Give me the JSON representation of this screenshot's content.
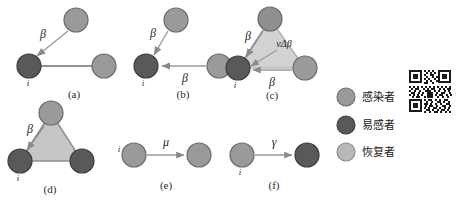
{
  "figure": {
    "title": "",
    "type": "diagram",
    "colors": {
      "infected": "#9a9a9a",
      "susceptible": "#595959",
      "recovered": "#b8b8b8",
      "node_stroke": "#4a4a4a",
      "edge": "#6e6e6e",
      "arrow": "#8a8a8a",
      "triangle_fill": "#c9c9c9",
      "text": "#1f1f1f",
      "background": "#ffffff"
    },
    "panels": [
      {
        "id": "a",
        "caption": "(a)",
        "nodes": [
          {
            "name": "top",
            "state": "infected",
            "cx": 76,
            "cy": 20,
            "r": 12
          },
          {
            "name": "left",
            "state": "susceptible",
            "cx": 29,
            "cy": 66,
            "r": 12,
            "label": "i"
          },
          {
            "name": "right",
            "state": "infected",
            "cx": 104,
            "cy": 66,
            "r": 12
          }
        ],
        "edges": [
          {
            "from": "left",
            "to": "right",
            "kind": "line"
          }
        ],
        "arrows": [
          {
            "from": "top",
            "to": "left",
            "label": "β"
          }
        ],
        "triangle": false
      },
      {
        "id": "b",
        "caption": "(b)",
        "nodes": [
          {
            "name": "top",
            "state": "infected",
            "cx": 176,
            "cy": 20,
            "r": 12
          },
          {
            "name": "left",
            "state": "susceptible",
            "cx": 146,
            "cy": 66,
            "r": 12,
            "label": "i"
          },
          {
            "name": "right",
            "state": "infected",
            "cx": 219,
            "cy": 66,
            "r": 12
          }
        ],
        "edges": [],
        "arrows": [
          {
            "from": "top",
            "to": "left",
            "label": "β"
          },
          {
            "from": "right",
            "to": "left",
            "label": "β"
          }
        ],
        "triangle": false
      },
      {
        "id": "c",
        "caption": "(c)",
        "nodes": [
          {
            "name": "top",
            "state": "infected",
            "cx": 270,
            "cy": 19,
            "r": 12
          },
          {
            "name": "left",
            "state": "susceptible",
            "cx": 238,
            "cy": 68,
            "r": 12,
            "label": "i"
          },
          {
            "name": "right",
            "state": "infected",
            "cx": 305,
            "cy": 68,
            "r": 12
          }
        ],
        "edges": [],
        "arrows": [
          {
            "from": "top",
            "to": "left",
            "label": "β"
          },
          {
            "from": "top-inner",
            "to": "left",
            "label": "νΔβ"
          },
          {
            "from": "right",
            "to": "left",
            "label": "β"
          }
        ],
        "triangle": true
      },
      {
        "id": "d",
        "caption": "(d)",
        "nodes": [
          {
            "name": "top",
            "state": "infected",
            "cx": 51,
            "cy": 113,
            "r": 12
          },
          {
            "name": "left",
            "state": "susceptible",
            "cx": 20,
            "cy": 161,
            "r": 12,
            "label": "i"
          },
          {
            "name": "right",
            "state": "susceptible",
            "cx": 82,
            "cy": 161,
            "r": 12
          }
        ],
        "edges": [],
        "arrows": [
          {
            "from": "top",
            "to": "left",
            "label": "β"
          }
        ],
        "triangle": true
      },
      {
        "id": "e",
        "caption": "(e)",
        "nodes": [
          {
            "name": "left",
            "state": "infected",
            "cx": 134,
            "cy": 155,
            "r": 12,
            "label": "i"
          },
          {
            "name": "right",
            "state": "infected",
            "cx": 199,
            "cy": 155,
            "r": 12
          }
        ],
        "edges": [],
        "arrows": [
          {
            "from": "left",
            "to": "right",
            "label": "μ"
          }
        ],
        "triangle": false
      },
      {
        "id": "f",
        "caption": "(f)",
        "nodes": [
          {
            "name": "left",
            "state": "infected",
            "cx": 242,
            "cy": 155,
            "r": 12,
            "label": "i"
          },
          {
            "name": "right",
            "state": "susceptible",
            "cx": 307,
            "cy": 155,
            "r": 12
          }
        ],
        "edges": [],
        "arrows": [
          {
            "from": "left",
            "to": "right",
            "label": "γ"
          }
        ],
        "triangle": false
      }
    ],
    "legend": {
      "items": [
        {
          "key": "infected",
          "label": "感染者",
          "color": "#9a9a9a"
        },
        {
          "key": "susceptible",
          "label": "易感者",
          "color": "#595959"
        },
        {
          "key": "recovered",
          "label": "恢复者",
          "color": "#b8b8b8"
        }
      ]
    },
    "qr_code": {
      "present": true,
      "label": "qr-code"
    }
  }
}
